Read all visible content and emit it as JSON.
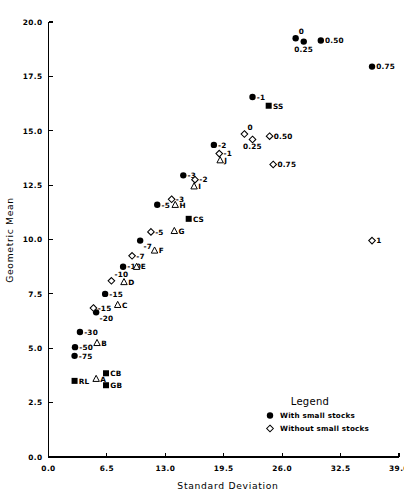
{
  "chart_data": {
    "type": "scatter",
    "title": "",
    "xlabel": "Standard Deviation",
    "ylabel": "Geometric Mean",
    "xlim": [
      0.0,
      39.0
    ],
    "ylim": [
      0.0,
      20.0
    ],
    "xticks": [
      "0.0",
      "6.5",
      "13.0",
      "19.5",
      "26.0",
      "32.5",
      "39.0"
    ],
    "xtick_values": [
      0.0,
      6.5,
      13.0,
      19.5,
      26.0,
      32.5,
      39.0
    ],
    "yticks": [
      "0.0",
      "2.5",
      "5.0",
      "7.5",
      "10.0",
      "12.5",
      "15.0",
      "17.5",
      "20.0"
    ],
    "ytick_values": [
      0.0,
      2.5,
      5.0,
      7.5,
      10.0,
      12.5,
      15.0,
      17.5,
      20.0
    ],
    "grid": false,
    "legend_position": "bottom-right",
    "series": [
      {
        "name": "With small stocks",
        "marker": "filled-circle",
        "points": [
          {
            "label": "-75",
            "x": 2.9,
            "y": 4.65,
            "label_pos": "right"
          },
          {
            "label": "-50",
            "x": 2.95,
            "y": 5.05,
            "label_pos": "right"
          },
          {
            "label": "-30",
            "x": 3.5,
            "y": 5.75,
            "label_pos": "right"
          },
          {
            "label": "-20",
            "x": 5.3,
            "y": 6.65,
            "label_pos": "below-right"
          },
          {
            "label": "-15",
            "x": 6.3,
            "y": 7.5,
            "label_pos": "right"
          },
          {
            "label": "-10",
            "x": 8.3,
            "y": 8.75,
            "label_pos": "right"
          },
          {
            "label": "-7",
            "x": 10.2,
            "y": 9.95,
            "label_pos": "below-right"
          },
          {
            "label": "-5",
            "x": 12.1,
            "y": 11.6,
            "label_pos": "right"
          },
          {
            "label": "-3",
            "x": 15.0,
            "y": 12.95,
            "label_pos": "right"
          },
          {
            "label": "-2",
            "x": 18.4,
            "y": 14.35,
            "label_pos": "right"
          },
          {
            "label": "-1",
            "x": 22.7,
            "y": 16.55,
            "label_pos": "right"
          },
          {
            "label": "0",
            "x": 27.5,
            "y": 19.25,
            "label_pos": "above-right"
          },
          {
            "label": "0.25",
            "x": 28.4,
            "y": 19.1,
            "label_pos": "below"
          },
          {
            "label": "0.50",
            "x": 30.3,
            "y": 19.15,
            "label_pos": "right"
          },
          {
            "label": "0.75",
            "x": 36.0,
            "y": 17.95,
            "label_pos": "right"
          }
        ]
      },
      {
        "name": "Without small stocks",
        "marker": "open-diamond",
        "points": [
          {
            "label": "-15",
            "x": 5.0,
            "y": 6.85,
            "label_pos": "right"
          },
          {
            "label": "-10",
            "x": 7.0,
            "y": 8.1,
            "label_pos": "above-right"
          },
          {
            "label": "-7",
            "x": 9.3,
            "y": 9.25,
            "label_pos": "right"
          },
          {
            "label": "-5",
            "x": 11.4,
            "y": 10.35,
            "label_pos": "right"
          },
          {
            "label": "-3",
            "x": 13.7,
            "y": 11.85,
            "label_pos": "right"
          },
          {
            "label": "-2",
            "x": 16.3,
            "y": 12.75,
            "label_pos": "right"
          },
          {
            "label": "-1",
            "x": 19.0,
            "y": 13.95,
            "label_pos": "right"
          },
          {
            "label": "0",
            "x": 21.8,
            "y": 14.85,
            "label_pos": "above-right"
          },
          {
            "label": "0.25",
            "x": 22.7,
            "y": 14.6,
            "label_pos": "below"
          },
          {
            "label": "0.50",
            "x": 24.6,
            "y": 14.75,
            "label_pos": "right"
          },
          {
            "label": "0.75",
            "x": 25.0,
            "y": 13.45,
            "label_pos": "right"
          },
          {
            "label": "1",
            "x": 36.0,
            "y": 9.95,
            "label_pos": "right"
          }
        ]
      },
      {
        "name": "Labeled triangles",
        "marker": "open-triangle",
        "points": [
          {
            "label": "A",
            "x": 5.3,
            "y": 3.6,
            "label_pos": "right"
          },
          {
            "label": "B",
            "x": 5.4,
            "y": 5.25,
            "label_pos": "right"
          },
          {
            "label": "C",
            "x": 7.7,
            "y": 7.0,
            "label_pos": "right"
          },
          {
            "label": "D",
            "x": 8.4,
            "y": 8.05,
            "label_pos": "right"
          },
          {
            "label": "E",
            "x": 9.8,
            "y": 8.75,
            "label_pos": "right"
          },
          {
            "label": "F",
            "x": 11.8,
            "y": 9.5,
            "label_pos": "right"
          },
          {
            "label": "G",
            "x": 14.0,
            "y": 10.4,
            "label_pos": "right"
          },
          {
            "label": "H",
            "x": 14.1,
            "y": 11.6,
            "label_pos": "right"
          },
          {
            "label": "I",
            "x": 16.2,
            "y": 12.45,
            "label_pos": "right"
          },
          {
            "label": "J",
            "x": 19.1,
            "y": 13.65,
            "label_pos": "right"
          }
        ]
      },
      {
        "name": "Benchmark squares",
        "marker": "filled-square",
        "points": [
          {
            "label": "RL",
            "x": 2.9,
            "y": 3.5,
            "label_pos": "right"
          },
          {
            "label": "CB",
            "x": 6.4,
            "y": 3.85,
            "label_pos": "right"
          },
          {
            "label": "GB",
            "x": 6.4,
            "y": 3.3,
            "label_pos": "right"
          },
          {
            "label": "CS",
            "x": 15.6,
            "y": 10.95,
            "label_pos": "right"
          },
          {
            "label": "SS",
            "x": 24.5,
            "y": 16.15,
            "label_pos": "right"
          }
        ]
      }
    ]
  },
  "legend": {
    "title": "Legend",
    "entries": [
      {
        "marker": "filled-circle",
        "label": "With small stocks"
      },
      {
        "marker": "open-diamond",
        "label": "Without small stocks"
      }
    ]
  }
}
